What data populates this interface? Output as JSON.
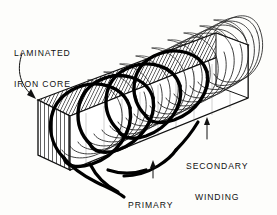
{
  "figure": {
    "kind": "technical-line-illustration",
    "width": 277,
    "height": 215,
    "background_color": "#fdfdfb",
    "ink_color": "#111111"
  },
  "labels": {
    "laminated_iron_core": {
      "line1": "LAMINATED",
      "line2": "IRON CORE"
    },
    "secondary_winding": {
      "line1": "SECONDARY",
      "line2": "WINDING"
    },
    "primary_winding": {
      "line1": "PRIMARY",
      "line2": "WINDING"
    }
  },
  "parts": {
    "core": {
      "name": "laminated-iron-core",
      "shape": "rectangular-prism",
      "hatch": "fine-parallel-lamination-lines",
      "face_color": "#ffffff",
      "line_color": "#1a1a1a"
    },
    "secondary_winding": {
      "name": "secondary-winding",
      "style": "fine-thin-wire-mesh",
      "turns": 22,
      "line_color": "#222222"
    },
    "primary_winding": {
      "name": "primary-winding",
      "style": "thick-heavy-wire-loops",
      "turns": 4,
      "line_color": "#000000",
      "leads": 2
    }
  },
  "leaders": {
    "core_leader": {
      "style": "curved-arrow",
      "points_to": "core-top-left-corner"
    },
    "secondary_leader": {
      "style": "straight-arrow",
      "points_to": "secondary-winding-mesh"
    },
    "primary_leader": {
      "style": "straight-arrow",
      "points_to": "primary-winding-lead"
    }
  }
}
